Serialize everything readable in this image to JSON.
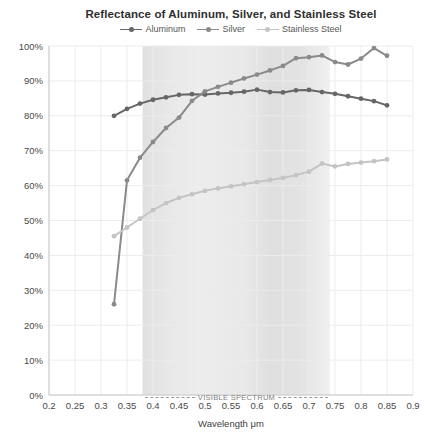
{
  "title": "Reflectance of Aluminum, Silver, and Stainless Steel",
  "chart_data": {
    "type": "line",
    "x": [
      0.325,
      0.35,
      0.375,
      0.4,
      0.425,
      0.45,
      0.475,
      0.5,
      0.525,
      0.55,
      0.575,
      0.6,
      0.625,
      0.65,
      0.675,
      0.7,
      0.725,
      0.75,
      0.775,
      0.8,
      0.825,
      0.85
    ],
    "series": [
      {
        "name": "Aluminum",
        "color": "#666666",
        "values": [
          80,
          82,
          83.5,
          84.6,
          85.3,
          86,
          86.2,
          86.1,
          86.4,
          86.6,
          86.9,
          87.5,
          86.8,
          86.7,
          87.3,
          87.4,
          86.8,
          86.3,
          85.6,
          84.9,
          84.2,
          83
        ]
      },
      {
        "name": "Silver",
        "color": "#8a8a8a",
        "values": [
          26,
          61.5,
          68,
          72.5,
          76.5,
          79.5,
          84.3,
          87,
          88.3,
          89.5,
          90.7,
          91.8,
          93,
          94.3,
          96.5,
          96.8,
          97.3,
          95.4,
          94.7,
          96.4,
          99.4,
          97.2
        ]
      },
      {
        "name": "Stainless Steel",
        "color": "#c4c4c4",
        "values": [
          45.5,
          48,
          50.5,
          53,
          55,
          56.5,
          57.5,
          58.5,
          59.2,
          59.8,
          60.4,
          61,
          61.6,
          62.2,
          63,
          64,
          66.3,
          65.5,
          66.2,
          66.6,
          67,
          67.5
        ]
      }
    ],
    "xlabel": "Wavelength μm",
    "ylabel": "",
    "xlim": [
      0.2,
      0.9
    ],
    "ylim": [
      0,
      100
    ],
    "x_tick_labels": [
      "0.2",
      "0.25",
      "0.3",
      "0.35",
      "0.4",
      "0.45",
      "0.5",
      "0.55",
      "0.6",
      "0.65",
      "0.7",
      "0.75",
      "0.8",
      "0.85",
      "0.9"
    ],
    "x_tick_values": [
      0.2,
      0.25,
      0.3,
      0.35,
      0.4,
      0.45,
      0.5,
      0.55,
      0.6,
      0.65,
      0.7,
      0.75,
      0.8,
      0.85,
      0.9
    ],
    "y_tick_labels": [
      "0%",
      "10%",
      "20%",
      "30%",
      "40%",
      "50%",
      "60%",
      "70%",
      "80%",
      "90%",
      "100%"
    ],
    "y_tick_values": [
      0,
      10,
      20,
      30,
      40,
      50,
      60,
      70,
      80,
      90,
      100
    ],
    "grid": true,
    "legend_position": "top",
    "annotations": {
      "visible_spectrum": {
        "label": "VISIBLE SPECTRUM",
        "x_start": 0.38,
        "x_end": 0.74
      }
    }
  },
  "colors": {
    "background": "#ffffff",
    "grid": "#ececec",
    "axis": "#c8c8c8",
    "title_text": "#2f2f2f",
    "tick_text": "#4a4a4a",
    "legend_text": "#555555",
    "spectrum_label_text": "#7f7f7f",
    "band_gradient": [
      {
        "offset": "0%",
        "color": "#e0e0e0"
      },
      {
        "offset": "12%",
        "color": "#e7e7e7"
      },
      {
        "offset": "30%",
        "color": "#ededed"
      },
      {
        "offset": "55%",
        "color": "#e8e8e8"
      },
      {
        "offset": "68%",
        "color": "#dfdfdf"
      },
      {
        "offset": "85%",
        "color": "#e3e3e3"
      },
      {
        "offset": "100%",
        "color": "#f0f0f0"
      }
    ]
  }
}
